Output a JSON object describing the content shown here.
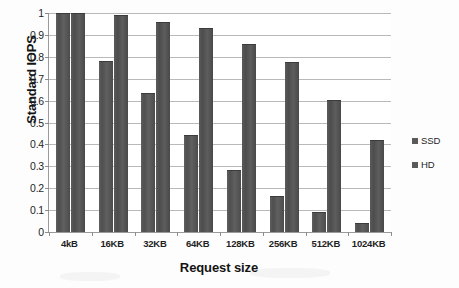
{
  "chart_data": {
    "type": "bar",
    "title": "",
    "xlabel": "Request size",
    "ylabel": "Standard IOPS",
    "categories": [
      "4kB",
      "16KB",
      "32KB",
      "64KB",
      "128KB",
      "256KB",
      "512KB",
      "1024KB"
    ],
    "series": [
      {
        "name": "SSD",
        "values": [
          1.0,
          0.78,
          0.635,
          0.445,
          0.285,
          0.165,
          0.09,
          0.04
        ]
      },
      {
        "name": "HD",
        "values": [
          1.0,
          0.99,
          0.96,
          0.93,
          0.86,
          0.775,
          0.605,
          0.42
        ]
      }
    ],
    "ylim": [
      0,
      1
    ],
    "ytick_labels": [
      "0",
      "0.1",
      "0.2",
      "0.3",
      "0.4",
      "0.5",
      "0.6",
      "0.7",
      "0.8",
      "0.9",
      "1"
    ],
    "ytick_values": [
      0,
      0.1,
      0.2,
      0.3,
      0.4,
      0.5,
      0.6,
      0.7,
      0.8,
      0.9,
      1
    ],
    "grid": true,
    "grid_axis": "y",
    "legend_position": "right",
    "bar_color": "#555555",
    "gridline_color": "#b9b9b9",
    "axis_color": "#9a9a9a",
    "background": "#ffffff"
  },
  "legend": {
    "items": [
      {
        "label": "SSD",
        "color": "#5a5a5a"
      },
      {
        "label": "HD",
        "color": "#5a5a5a"
      }
    ]
  }
}
